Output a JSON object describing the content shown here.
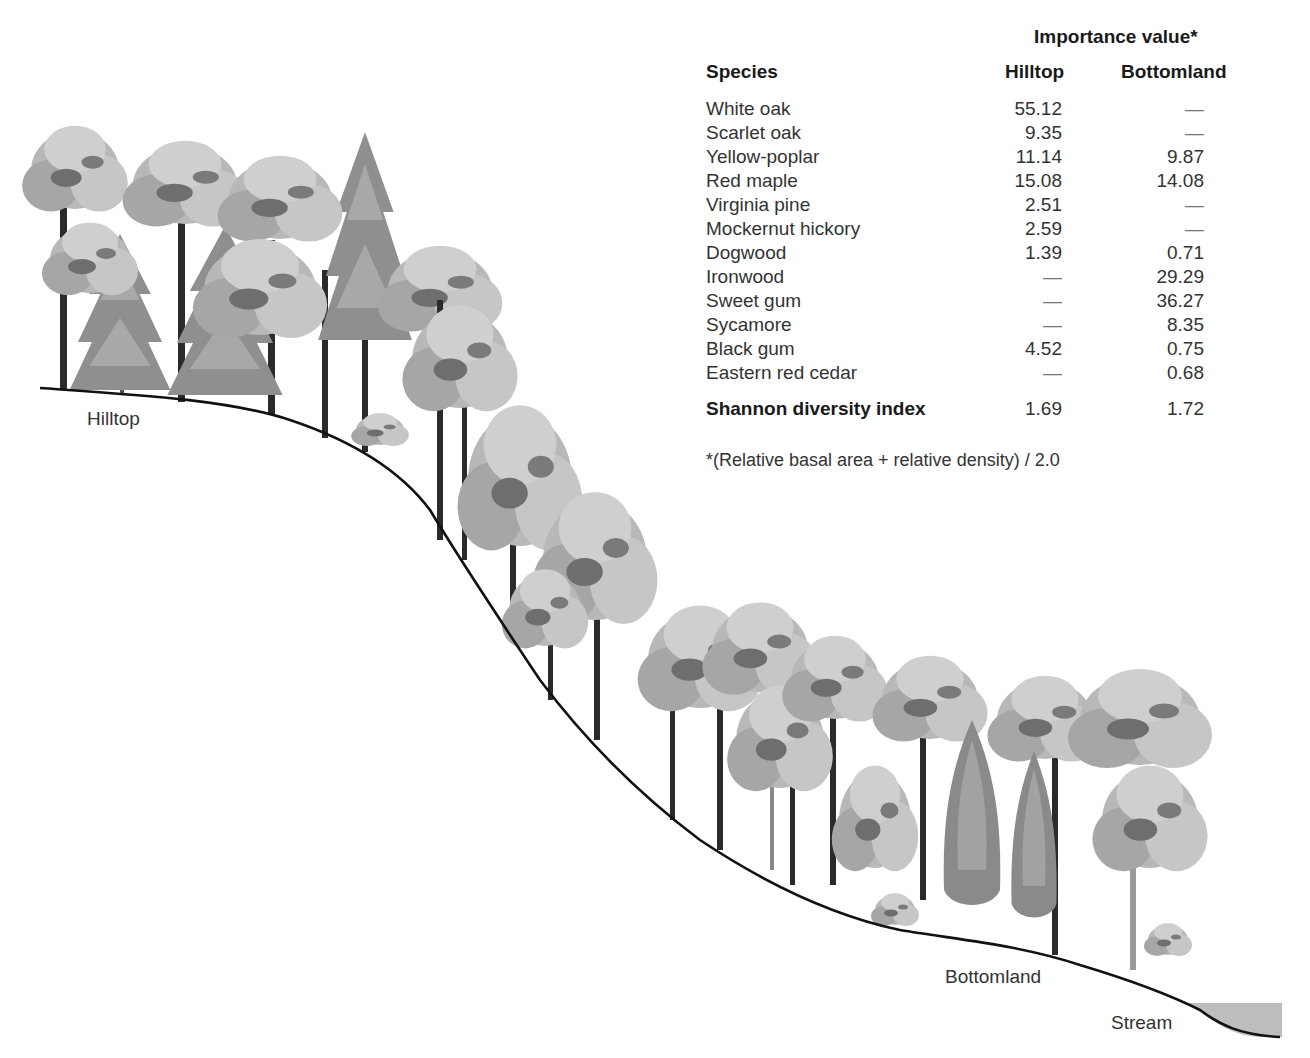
{
  "table": {
    "group_header": "Importance value*",
    "columns": {
      "species": "Species",
      "hilltop": "Hilltop",
      "bottomland": "Bottomland"
    },
    "rows": [
      {
        "species": "White oak",
        "hilltop": "55.12",
        "bottomland": "—"
      },
      {
        "species": "Scarlet oak",
        "hilltop": "9.35",
        "bottomland": "—"
      },
      {
        "species": "Yellow-poplar",
        "hilltop": "11.14",
        "bottomland": "9.87"
      },
      {
        "species": "Red maple",
        "hilltop": "15.08",
        "bottomland": "14.08"
      },
      {
        "species": "Virginia pine",
        "hilltop": "2.51",
        "bottomland": "—"
      },
      {
        "species": "Mockernut hickory",
        "hilltop": "2.59",
        "bottomland": "—"
      },
      {
        "species": "Dogwood",
        "hilltop": "1.39",
        "bottomland": "0.71"
      },
      {
        "species": "Ironwood",
        "hilltop": "—",
        "bottomland": "29.29"
      },
      {
        "species": "Sweet gum",
        "hilltop": "—",
        "bottomland": "36.27"
      },
      {
        "species": "Sycamore",
        "hilltop": "—",
        "bottomland": "8.35"
      },
      {
        "species": "Black gum",
        "hilltop": "4.52",
        "bottomland": "0.75"
      },
      {
        "species": "Eastern red cedar",
        "hilltop": "—",
        "bottomland": "0.68"
      }
    ],
    "summary": {
      "label": "Shannon diversity index",
      "hilltop": "1.69",
      "bottomland": "1.72"
    },
    "footnote": "*(Relative basal area + relative density) / 2.0"
  },
  "illustration": {
    "labels": {
      "hilltop": "Hilltop",
      "bottomland": "Bottomland",
      "stream": "Stream"
    },
    "colors": {
      "ground_line": "#111111",
      "canopy_light": "#c4c4c4",
      "canopy_mid": "#a3a3a3",
      "canopy_dark": "#6e6e6e",
      "trunk": "#2a2a2a",
      "stream_fill": "#bdbdbd"
    }
  }
}
